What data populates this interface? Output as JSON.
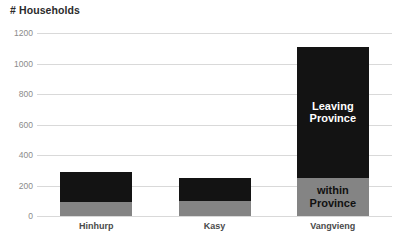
{
  "chart_data": {
    "type": "bar",
    "title": "# Households",
    "xlabel": "",
    "ylabel": "",
    "stacked": true,
    "grid": true,
    "legend_position": "in-bars",
    "categories": [
      "Hinhurp",
      "Kasy",
      "Vangvieng"
    ],
    "ylim": [
      0,
      1200
    ],
    "yticks": [
      0,
      200,
      400,
      600,
      800,
      1000,
      1200
    ],
    "ytick_labels": [
      "0",
      "200",
      "400",
      "600",
      "800",
      "1000",
      "1200"
    ],
    "series": [
      {
        "name": "within Province",
        "color": "#848484",
        "values": [
          90,
          100,
          250
        ]
      },
      {
        "name": "Leaving Province",
        "color": "#131313",
        "values": [
          200,
          150,
          860
        ]
      }
    ],
    "totals": [
      290,
      250,
      1110
    ],
    "annotations": [
      {
        "text": "Leaving\nProvince",
        "series": "Leaving Province",
        "category": "Vangvieng",
        "color": "#ffffff"
      },
      {
        "text": "within\nProvince",
        "series": "within Province",
        "category": "Vangvieng",
        "color": "#111111"
      }
    ]
  },
  "style": {
    "background": "#ffffff",
    "gridline_color": "#d9d9d9",
    "tick_text_color": "#8b8b8b",
    "category_text_color": "#4a4a4a",
    "title_color": "#2b2b2b"
  }
}
